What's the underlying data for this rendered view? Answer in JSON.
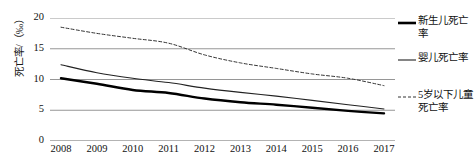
{
  "chart_data": {
    "type": "line",
    "title": "",
    "xlabel": "",
    "ylabel": "死亡率/（‰）",
    "x": [
      2008,
      2009,
      2010,
      2011,
      2012,
      2013,
      2014,
      2015,
      2016,
      2017
    ],
    "xticklabels": [
      "2008",
      "2009",
      "2010",
      "2011",
      "2012",
      "2013",
      "2014",
      "2015",
      "2016",
      "2017"
    ],
    "yticklabels": [
      "0",
      "5",
      "10",
      "15",
      "20"
    ],
    "yticks": [
      0,
      5,
      10,
      15,
      20
    ],
    "ylim": [
      0,
      20
    ],
    "grid": "horizontal",
    "legend_position": "right",
    "series": [
      {
        "name": "新生儿死亡率",
        "style": "solid-thick",
        "color": "#000000",
        "values": [
          10.2,
          9.3,
          8.3,
          7.8,
          6.9,
          6.3,
          5.9,
          5.4,
          4.9,
          4.5
        ]
      },
      {
        "name": "婴儿死亡率",
        "style": "solid-thin",
        "color": "#222222",
        "values": [
          12.4,
          11.1,
          10.2,
          9.5,
          8.6,
          7.9,
          7.3,
          6.6,
          5.9,
          5.2
        ]
      },
      {
        "name": "5岁以下儿童死亡率",
        "style": "dashed",
        "color": "#333333",
        "values": [
          18.5,
          17.5,
          16.7,
          15.9,
          14.0,
          12.7,
          11.8,
          10.9,
          10.2,
          9.0
        ]
      }
    ]
  },
  "legend": {
    "items": [
      {
        "label": "新生儿死亡率",
        "swatch": "thick-solid-line-icon"
      },
      {
        "label": "婴儿死亡率",
        "swatch": "thin-solid-line-icon"
      },
      {
        "label": "5岁以下儿童死亡率",
        "swatch": "dashed-line-icon"
      }
    ]
  }
}
